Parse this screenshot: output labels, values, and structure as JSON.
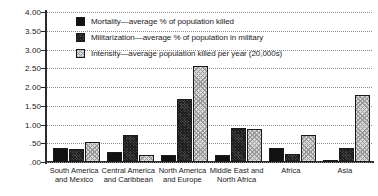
{
  "chart_data": {
    "type": "bar",
    "title": "",
    "xlabel": "",
    "ylabel": "",
    "ylim": [
      0,
      4
    ],
    "ytick_labels": [
      "4.00",
      "3.50",
      "3.00",
      "2.50",
      "2.00",
      "1.50",
      "1.00",
      ".50",
      ".00"
    ],
    "ytick_values": [
      4,
      3.5,
      3,
      2.5,
      2,
      1.5,
      1,
      0.5,
      0
    ],
    "grid": true,
    "legend_position": "top-left-inside",
    "categories": [
      "South America\nand Mexico",
      "Central America\nand Caribbean",
      "North America\nand Europe",
      "Middle East and\nNorth Africa",
      "Africa",
      "Asia"
    ],
    "series": [
      {
        "name": "Mortality—average % of population killed",
        "values": [
          0.38,
          0.28,
          0.2,
          0.19,
          0.37,
          0.05
        ]
      },
      {
        "name": "Militarization—average % of population in military",
        "values": [
          0.34,
          0.73,
          1.67,
          0.9,
          0.22,
          0.38
        ]
      },
      {
        "name": "Intensity—average population killed per year (20,000s)",
        "values": [
          0.54,
          0.2,
          2.55,
          0.88,
          0.72,
          1.8
        ]
      }
    ]
  },
  "legend": {
    "items": [
      "Mortality—average % of population killed",
      "Militarization—average % of population in military",
      "Intensity—average population killed per year (20,000s)"
    ]
  },
  "colors": {
    "series_mortality": "#111111",
    "series_militarization": "#4a4a4a",
    "series_intensity": "#d9d9d9",
    "axis": "#2b2b2b",
    "gridline": "#8d8d8d",
    "text": "#1a1a1a",
    "background": "#ffffff"
  }
}
